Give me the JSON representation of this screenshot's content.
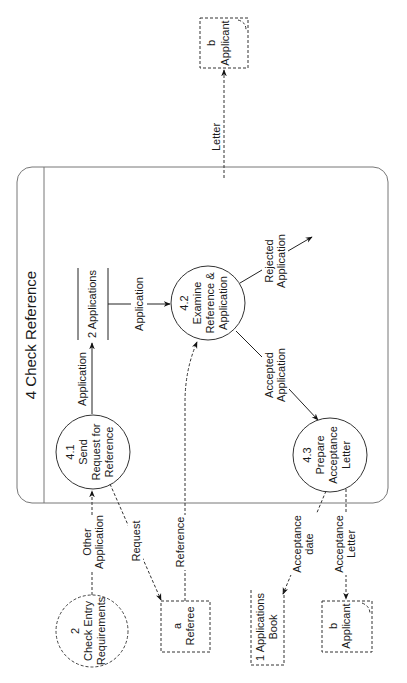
{
  "diagram": {
    "type": "data-flow-diagram",
    "orientation": "rotated-90-ccw",
    "frame": {
      "title": "4 Check Reference"
    },
    "processes": [
      {
        "id": "4.1",
        "lines": [
          "4.1",
          "Send",
          "Request for",
          "Reference"
        ]
      },
      {
        "id": "4.2",
        "lines": [
          "4.2",
          "Examine",
          "Reference &",
          "Application"
        ]
      },
      {
        "id": "4.3",
        "lines": [
          "4.3",
          "Prepare",
          "Acceptance",
          "Letter"
        ]
      }
    ],
    "external_processes": [
      {
        "id": "2",
        "lines": [
          "2",
          "Check Entry",
          "Requirements"
        ]
      }
    ],
    "data_stores": [
      {
        "id": "2",
        "label": "2 Applications"
      },
      {
        "id": "1",
        "lines": [
          "1 Applications",
          "Book"
        ]
      }
    ],
    "external_entities": [
      {
        "id": "a",
        "lines": [
          "a",
          "Referee"
        ]
      },
      {
        "id": "b",
        "lines": [
          "b",
          "Applicant"
        ],
        "position": "bottom"
      },
      {
        "id": "b",
        "lines": [
          "b",
          "Applicant"
        ],
        "position": "top"
      }
    ],
    "flows": [
      {
        "from": "4.1",
        "to": "2 Applications",
        "lines": [
          "Application"
        ]
      },
      {
        "from": "2 Applications",
        "to": "4.2",
        "lines": [
          "Application"
        ]
      },
      {
        "from": "4.2",
        "to": "outside",
        "lines": [
          "Rejected",
          "Application"
        ]
      },
      {
        "from": "4.2",
        "to": "4.3",
        "lines": [
          "Accepted",
          "Application"
        ]
      },
      {
        "from": "2 Check Entry Requirements",
        "to": "4.1",
        "lines": [
          "Other",
          "Application"
        ]
      },
      {
        "from": "4.1",
        "to": "a Referee",
        "lines": [
          "Request"
        ]
      },
      {
        "from": "a Referee",
        "to": "4.2",
        "lines": [
          "Reference"
        ]
      },
      {
        "from": "4.3",
        "to": "1 Applications Book",
        "lines": [
          "Acceptance",
          "date"
        ]
      },
      {
        "from": "4.3",
        "to": "b Applicant",
        "lines": [
          "Acceptance",
          "Letter"
        ]
      },
      {
        "from": "frame",
        "to": "b Applicant (top)",
        "lines": [
          "Letter"
        ]
      }
    ]
  }
}
